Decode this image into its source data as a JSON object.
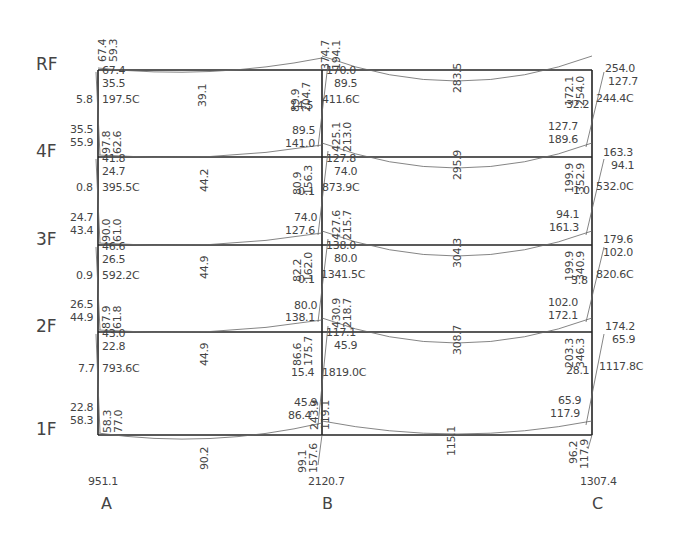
{
  "diagram": {
    "type": "frame-moment-diagram",
    "columns": [
      {
        "id": "A",
        "label": "A",
        "x": 98,
        "base_reaction": "951.1"
      },
      {
        "id": "B",
        "label": "B",
        "x": 322,
        "base_reaction": "2120.7"
      },
      {
        "id": "C",
        "label": "C",
        "x": 592,
        "base_reaction": "1307.4"
      }
    ],
    "floors": [
      {
        "label": "RF",
        "y": 70
      },
      {
        "label": "4F",
        "y": 157
      },
      {
        "label": "3F",
        "y": 245
      },
      {
        "label": "2F",
        "y": 332
      },
      {
        "label": "1F",
        "y": 435
      }
    ],
    "labels": [
      {
        "t": "67.4",
        "x": 97,
        "y": 62,
        "r": true
      },
      {
        "t": "59.3",
        "x": 108,
        "y": 62,
        "r": true
      },
      {
        "t": "67.4",
        "x": 102,
        "y": 75
      },
      {
        "t": "35.5",
        "x": 102,
        "y": 88
      },
      {
        "t": "5.8",
        "x": 76,
        "y": 104
      },
      {
        "t": "197.5C",
        "x": 102,
        "y": 104
      },
      {
        "t": "39.1",
        "x": 197,
        "y": 107,
        "r": true
      },
      {
        "t": "89.9",
        "x": 290,
        "y": 112,
        "r": true
      },
      {
        "t": "204.7",
        "x": 301,
        "y": 112,
        "r": true
      },
      {
        "t": "374.7",
        "x": 320,
        "y": 70,
        "r": true
      },
      {
        "t": "194.1",
        "x": 331,
        "y": 70,
        "r": true
      },
      {
        "t": "170.0",
        "x": 326,
        "y": 75
      },
      {
        "t": "89.5",
        "x": 334,
        "y": 88
      },
      {
        "t": "14.5",
        "x": 290,
        "y": 110
      },
      {
        "t": "411.6C",
        "x": 322,
        "y": 104
      },
      {
        "t": "283.5",
        "x": 452,
        "y": 93,
        "r": true
      },
      {
        "t": "172.1",
        "x": 564,
        "y": 106,
        "r": true
      },
      {
        "t": "254.0",
        "x": 575,
        "y": 106,
        "r": true
      },
      {
        "t": "254.0",
        "x": 605,
        "y": 73
      },
      {
        "t": "127.7",
        "x": 608,
        "y": 86
      },
      {
        "t": "32.2",
        "x": 566,
        "y": 109
      },
      {
        "t": "244.4C",
        "x": 596,
        "y": 103
      },
      {
        "t": "35.5",
        "x": 70,
        "y": 134
      },
      {
        "t": "55.9",
        "x": 70,
        "y": 147
      },
      {
        "t": "97.8",
        "x": 101,
        "y": 154,
        "r": true
      },
      {
        "t": "62.6",
        "x": 112,
        "y": 154,
        "r": true
      },
      {
        "t": "41.8",
        "x": 102,
        "y": 163
      },
      {
        "t": "24.7",
        "x": 102,
        "y": 176
      },
      {
        "t": "0.8",
        "x": 76,
        "y": 192
      },
      {
        "t": "395.5C",
        "x": 102,
        "y": 192
      },
      {
        "t": "44.2",
        "x": 199,
        "y": 192,
        "r": true
      },
      {
        "t": "89.5",
        "x": 292,
        "y": 135
      },
      {
        "t": "141.0",
        "x": 285,
        "y": 148
      },
      {
        "t": "425.1",
        "x": 331,
        "y": 152,
        "r": true
      },
      {
        "t": "213.0",
        "x": 342,
        "y": 152,
        "r": true
      },
      {
        "t": "80.9",
        "x": 292,
        "y": 195,
        "r": true
      },
      {
        "t": "156.3",
        "x": 303,
        "y": 195,
        "r": true
      },
      {
        "t": "127.8",
        "x": 326,
        "y": 163
      },
      {
        "t": "74.0",
        "x": 334,
        "y": 176
      },
      {
        "t": "0.1",
        "x": 298,
        "y": 196
      },
      {
        "t": "873.9C",
        "x": 322,
        "y": 192
      },
      {
        "t": "295.9",
        "x": 452,
        "y": 180,
        "r": true
      },
      {
        "t": "127.7",
        "x": 548,
        "y": 131
      },
      {
        "t": "189.6",
        "x": 548,
        "y": 144
      },
      {
        "t": "199.9",
        "x": 564,
        "y": 193,
        "r": true
      },
      {
        "t": "352.9",
        "x": 575,
        "y": 193,
        "r": true
      },
      {
        "t": "163.3",
        "x": 603,
        "y": 157
      },
      {
        "t": "94.1",
        "x": 611,
        "y": 170
      },
      {
        "t": "1.0",
        "x": 573,
        "y": 195
      },
      {
        "t": "532.0C",
        "x": 596,
        "y": 191
      },
      {
        "t": "24.7",
        "x": 70,
        "y": 222
      },
      {
        "t": "43.4",
        "x": 70,
        "y": 235
      },
      {
        "t": "90.0",
        "x": 101,
        "y": 242,
        "r": true
      },
      {
        "t": "61.0",
        "x": 112,
        "y": 242,
        "r": true
      },
      {
        "t": "46.6",
        "x": 102,
        "y": 251
      },
      {
        "t": "26.5",
        "x": 102,
        "y": 264
      },
      {
        "t": "0.9",
        "x": 76,
        "y": 280
      },
      {
        "t": "592.2C",
        "x": 102,
        "y": 280
      },
      {
        "t": "44.9",
        "x": 199,
        "y": 279,
        "r": true
      },
      {
        "t": "74.0",
        "x": 294,
        "y": 222
      },
      {
        "t": "127.6",
        "x": 285,
        "y": 235
      },
      {
        "t": "427.6",
        "x": 331,
        "y": 240,
        "r": true
      },
      {
        "t": "215.7",
        "x": 342,
        "y": 240,
        "r": true
      },
      {
        "t": "82.2",
        "x": 292,
        "y": 282,
        "r": true
      },
      {
        "t": "162.0",
        "x": 303,
        "y": 282,
        "r": true
      },
      {
        "t": "138.0",
        "x": 326,
        "y": 250
      },
      {
        "t": "80.0",
        "x": 334,
        "y": 263
      },
      {
        "t": "0.1",
        "x": 298,
        "y": 284
      },
      {
        "t": "1341.5C",
        "x": 321,
        "y": 279
      },
      {
        "t": "304.3",
        "x": 452,
        "y": 268,
        "r": true
      },
      {
        "t": "94.1",
        "x": 556,
        "y": 219
      },
      {
        "t": "161.3",
        "x": 549,
        "y": 232
      },
      {
        "t": "199.9",
        "x": 564,
        "y": 281,
        "r": true
      },
      {
        "t": "340.9",
        "x": 575,
        "y": 281,
        "r": true
      },
      {
        "t": "179.6",
        "x": 603,
        "y": 244
      },
      {
        "t": "102.0",
        "x": 603,
        "y": 257
      },
      {
        "t": "3.8",
        "x": 571,
        "y": 285
      },
      {
        "t": "820.6C",
        "x": 596,
        "y": 279
      },
      {
        "t": "26.5",
        "x": 70,
        "y": 309
      },
      {
        "t": "44.9",
        "x": 70,
        "y": 322
      },
      {
        "t": "87.9",
        "x": 101,
        "y": 329,
        "r": true
      },
      {
        "t": "61.8",
        "x": 112,
        "y": 329,
        "r": true
      },
      {
        "t": "43.0",
        "x": 102,
        "y": 338
      },
      {
        "t": "22.8",
        "x": 102,
        "y": 351
      },
      {
        "t": "7.7",
        "x": 78,
        "y": 373
      },
      {
        "t": "793.6C",
        "x": 102,
        "y": 373
      },
      {
        "t": "44.9",
        "x": 199,
        "y": 366,
        "r": true
      },
      {
        "t": "80.0",
        "x": 294,
        "y": 310
      },
      {
        "t": "138.1",
        "x": 285,
        "y": 322
      },
      {
        "t": "430.9",
        "x": 331,
        "y": 328,
        "r": true
      },
      {
        "t": "218.7",
        "x": 342,
        "y": 328,
        "r": true
      },
      {
        "t": "86.6",
        "x": 292,
        "y": 366,
        "r": true
      },
      {
        "t": "175.7",
        "x": 303,
        "y": 366,
        "r": true
      },
      {
        "t": "117.1",
        "x": 326,
        "y": 337
      },
      {
        "t": "45.9",
        "x": 334,
        "y": 350
      },
      {
        "t": "15.4",
        "x": 291,
        "y": 377
      },
      {
        "t": "1819.0C",
        "x": 322,
        "y": 377
      },
      {
        "t": "308.7",
        "x": 452,
        "y": 355,
        "r": true
      },
      {
        "t": "102.0",
        "x": 548,
        "y": 307
      },
      {
        "t": "172.1",
        "x": 548,
        "y": 320
      },
      {
        "t": "203.3",
        "x": 564,
        "y": 368,
        "r": true
      },
      {
        "t": "346.3",
        "x": 575,
        "y": 368,
        "r": true
      },
      {
        "t": "174.2",
        "x": 605,
        "y": 331
      },
      {
        "t": "65.9",
        "x": 612,
        "y": 344
      },
      {
        "t": "28.1",
        "x": 566,
        "y": 375
      },
      {
        "t": "1117.8C",
        "x": 599,
        "y": 371
      },
      {
        "t": "22.8",
        "x": 70,
        "y": 412
      },
      {
        "t": "58.3",
        "x": 70,
        "y": 425
      },
      {
        "t": "58.3",
        "x": 102,
        "y": 433,
        "r": true
      },
      {
        "t": "77.0",
        "x": 113,
        "y": 433,
        "r": true
      },
      {
        "t": "90.2",
        "x": 199,
        "y": 470,
        "r": true
      },
      {
        "t": "45.9",
        "x": 294,
        "y": 407
      },
      {
        "t": "86.4",
        "x": 288,
        "y": 420
      },
      {
        "t": "243.9",
        "x": 309,
        "y": 430,
        "r": true
      },
      {
        "t": "119.1",
        "x": 320,
        "y": 430,
        "r": true
      },
      {
        "t": "99.1",
        "x": 297,
        "y": 473,
        "r": true
      },
      {
        "t": "157.6",
        "x": 308,
        "y": 473,
        "r": true
      },
      {
        "t": "115.1",
        "x": 446,
        "y": 456,
        "r": true
      },
      {
        "t": "65.9",
        "x": 558,
        "y": 405
      },
      {
        "t": "117.9",
        "x": 550,
        "y": 418
      },
      {
        "t": "96.2",
        "x": 568,
        "y": 464,
        "r": true
      },
      {
        "t": "117.9",
        "x": 579,
        "y": 469,
        "r": true
      }
    ]
  }
}
